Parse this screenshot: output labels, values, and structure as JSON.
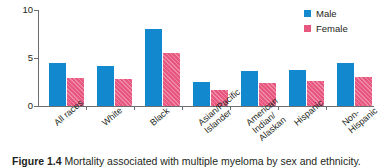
{
  "chart_data": {
    "type": "bar",
    "title": "",
    "xlabel": "",
    "ylabel": "Deaths per 100 000",
    "ylim": [
      0,
      10
    ],
    "yticks": [
      0,
      5,
      10
    ],
    "ytick_labels": [
      "0",
      "5",
      "10"
    ],
    "grid": false,
    "legend_position": "top-right",
    "categories": [
      "All races",
      "White",
      "Black",
      "Asian/Pacific\nIslander",
      "American\nIndian/\nAlaskan",
      "Hispanic",
      "Non-\nHispanic"
    ],
    "series": [
      {
        "name": "Male",
        "color": "#1288ce",
        "values": [
          4.5,
          4.2,
          8.0,
          2.5,
          3.6,
          3.7,
          4.5
        ]
      },
      {
        "name": "Female",
        "color": "#e8577f",
        "values": [
          2.9,
          2.8,
          5.5,
          1.7,
          2.4,
          2.6,
          3.0
        ]
      }
    ]
  },
  "legend": {
    "items": [
      {
        "label": "Male",
        "color": "#1288ce"
      },
      {
        "label": "Female",
        "color": "#e8577f"
      }
    ]
  },
  "caption": {
    "number": "Figure 1.4",
    "text": " Mortality associated with multiple myeloma by sex and ethnicity."
  }
}
